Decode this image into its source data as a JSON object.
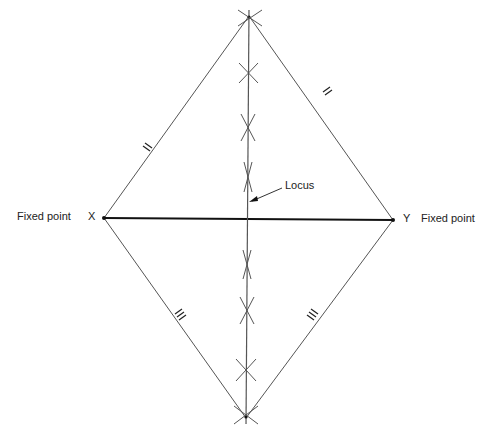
{
  "diagram": {
    "title": "",
    "points": {
      "X": {
        "label": "X",
        "x": 104,
        "y": 218
      },
      "Y": {
        "label": "Y",
        "x": 393,
        "y": 220
      },
      "top": {
        "x": 249,
        "y": 16
      },
      "bottom": {
        "x": 246,
        "y": 418
      }
    },
    "labels": {
      "fixed_point_left": "Fixed point",
      "x_label": "X",
      "y_label": "Y",
      "fixed_point_right": "Fixed point",
      "locus": "Locus"
    },
    "equal_marks": [
      {
        "edge": "X-top",
        "symbol": "=",
        "x": 147,
        "y": 150
      },
      {
        "edge": "top-Y",
        "symbol": "=",
        "x": 327,
        "y": 91
      },
      {
        "edge": "X-bottom",
        "symbol": "≡",
        "x": 181,
        "y": 314
      },
      {
        "edge": "bottom-Y",
        "symbol": "≡",
        "x": 313,
        "y": 317
      }
    ],
    "arc_intersections": [
      {
        "y": 20
      },
      {
        "y": 73
      },
      {
        "y": 127
      },
      {
        "y": 177
      },
      {
        "y": 264
      },
      {
        "y": 311
      },
      {
        "y": 370
      },
      {
        "y": 414
      }
    ],
    "colors": {
      "line": "#555555",
      "xy_line": "#111111",
      "text": "#222222"
    }
  }
}
